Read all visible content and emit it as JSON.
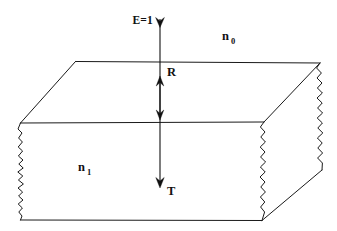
{
  "figure": {
    "type": "optics-slab-diagram",
    "background_color": "#ffffff",
    "line_color": "#1a1a1a",
    "text_color": "#111111"
  },
  "labels": {
    "incident": "E=1",
    "reflected": "R",
    "transmitted": "T",
    "medium_outer_base": "n",
    "medium_outer_sub": "0",
    "medium_inner_base": "n",
    "medium_inner_sub": "1"
  },
  "geometry": {
    "slab": {
      "top_back_left": [
        75,
        61
      ],
      "top_back_right": [
        320,
        63
      ],
      "top_front_left": [
        20,
        123
      ],
      "top_front_right": [
        264,
        122
      ],
      "bottom_front_left": [
        20,
        220
      ],
      "bottom_front_right": [
        262,
        220
      ],
      "bottom_back_right": [
        322,
        170
      ]
    },
    "rays": {
      "incident_x": 160,
      "incident_y_start": 22,
      "incident_y_end": 122,
      "reflected_y_top": 78,
      "reflected_y_bottom": 117,
      "transmitted_y_end": 186
    }
  },
  "annotations": {
    "incident_arrow": "arrow-down",
    "reflected_arrow": "double-headed-vertical",
    "transmitted_arrow": "arrow-down",
    "broken_edges": "jagged-left-and-right-faces"
  }
}
